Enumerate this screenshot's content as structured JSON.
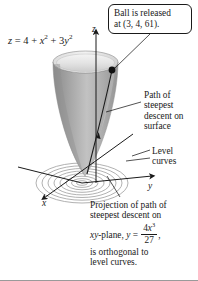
{
  "figure": {
    "surface_equation": {
      "lhs": "z",
      "eq": "=",
      "rhs_const": "4",
      "plus1": "+",
      "term_x": "x",
      "exp_x": "2",
      "plus2": "+",
      "coef_y": "3",
      "term_y": "y",
      "exp_y": "2",
      "full_text": "z = 4 + x2 + 3y2"
    },
    "callout": {
      "line1": "Ball is released",
      "line2": "at (3, 4, 61)."
    },
    "labels": {
      "path_of_steepest_descent": "Path of steepest descent on surface",
      "level_curves": "Level curves"
    },
    "projection_note": {
      "line1": "Projection of path of",
      "line2": "steepest descent on",
      "prefix": "xy",
      "plane_word": "-plane,",
      "var_y": "y",
      "equals": "=",
      "numerator_coef": "4",
      "numerator_var": "x",
      "numerator_exp": "3",
      "denominator": "27",
      "comma": ",",
      "line4": "is orthogonal to",
      "line5": "level curves."
    },
    "axes": {
      "x": "x",
      "y": "y",
      "z": "z"
    },
    "colors": {
      "ink": "#1a1a1a",
      "surface_dark": "#8d8d8d",
      "surface_mid": "#b0b0b0",
      "surface_light": "#e4e4e4",
      "rim_interior": "#efefef",
      "level_curve": "#a0a0a0",
      "background": "#ffffff"
    }
  }
}
